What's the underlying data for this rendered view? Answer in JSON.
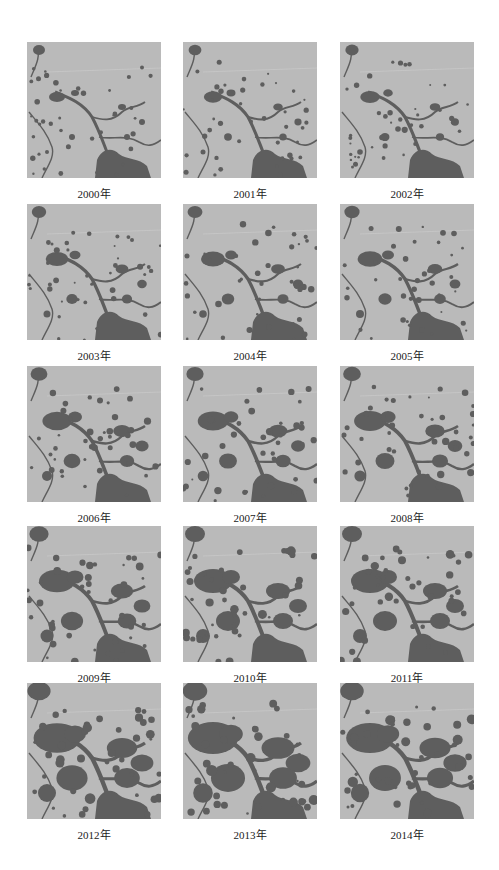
{
  "figure": {
    "background_color": "#ffffff",
    "land_color": "#bababa",
    "water_color": "#5e5e5e",
    "panels": [
      {
        "label": "2000年",
        "year": 2000,
        "extent": 0.0
      },
      {
        "label": "2001年",
        "year": 2001,
        "extent": 0.05
      },
      {
        "label": "2002年",
        "year": 2002,
        "extent": 0.08
      },
      {
        "label": "2003年",
        "year": 2003,
        "extent": 0.15
      },
      {
        "label": "2004年",
        "year": 2004,
        "extent": 0.18
      },
      {
        "label": "2005年",
        "year": 2005,
        "extent": 0.2
      },
      {
        "label": "2006年",
        "year": 2006,
        "extent": 0.3
      },
      {
        "label": "2007年",
        "year": 2007,
        "extent": 0.33
      },
      {
        "label": "2008年",
        "year": 2008,
        "extent": 0.36
      },
      {
        "label": "2009年",
        "year": 2009,
        "extent": 0.45
      },
      {
        "label": "2010年",
        "year": 2010,
        "extent": 0.5
      },
      {
        "label": "2011年",
        "year": 2011,
        "extent": 0.5
      },
      {
        "label": "2012年",
        "year": 2012,
        "extent": 0.7
      },
      {
        "label": "2013年",
        "year": 2013,
        "extent": 0.78
      },
      {
        "label": "2014年",
        "year": 2014,
        "extent": 0.72
      }
    ]
  }
}
